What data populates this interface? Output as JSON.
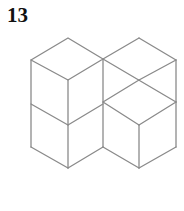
{
  "figure": {
    "number_label": "13",
    "line_color": "#8a8a8a"
  }
}
